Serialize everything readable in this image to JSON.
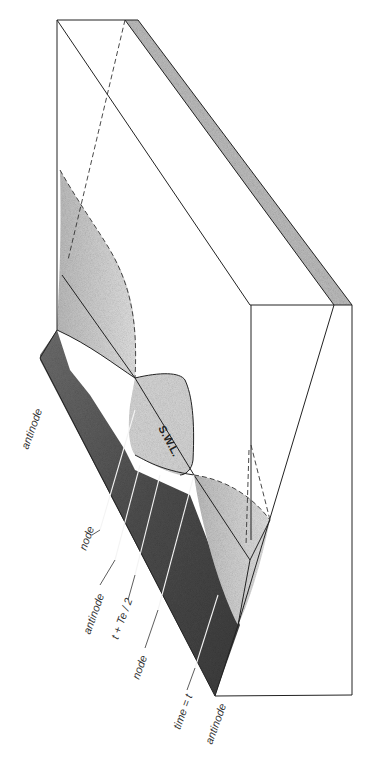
{
  "figure": {
    "type": "3d-block-diagram",
    "colors": {
      "outline": "#222222",
      "dark_stipple": "#5a5a5a",
      "medium_stipple": "#9a9a9a",
      "light_stipple": "#cfcfcf",
      "side_strip": "#bdbdbd",
      "background": "#ffffff"
    }
  },
  "labels": {
    "swl": "S.W.L.",
    "left_side": [
      {
        "id": "antinode_top",
        "text": "antinode"
      },
      {
        "id": "node_1",
        "text": "node"
      },
      {
        "id": "antinode_mid",
        "text": "antinode"
      },
      {
        "id": "half_period",
        "text": "t + Te / 2"
      },
      {
        "id": "node_2",
        "text": "node"
      },
      {
        "id": "time_t",
        "text": "time = t"
      },
      {
        "id": "antinode_bottom",
        "text": "antinode"
      }
    ]
  }
}
